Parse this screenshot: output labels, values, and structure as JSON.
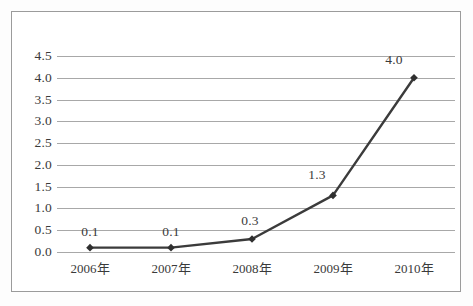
{
  "chart_data": {
    "type": "line",
    "title": "",
    "subtitle": "",
    "xlabel": "",
    "ylabel": "",
    "categories": [
      "2006年",
      "2007年",
      "2008年",
      "2009年",
      "2010年"
    ],
    "series": [
      {
        "name": "",
        "values": [
          0.1,
          0.1,
          0.3,
          1.3,
          4.0
        ],
        "point_labels": [
          "0.1",
          "0.1",
          "0.3",
          "1.3",
          "4.0"
        ],
        "line_color": "#3b3b3b",
        "marker": "diamond",
        "marker_color": "#2f2f2f"
      }
    ],
    "ylim": [
      0.0,
      4.5
    ],
    "ytick_step": 0.5,
    "ytick_labels": [
      "0.0",
      "0.5",
      "1.0",
      "1.5",
      "2.0",
      "2.5",
      "3.0",
      "3.5",
      "4.0",
      "4.5"
    ],
    "ytick_values": [
      0.0,
      0.5,
      1.0,
      1.5,
      2.0,
      2.5,
      3.0,
      3.5,
      4.0,
      4.5
    ],
    "grid": {
      "horizontal": true,
      "vertical": false,
      "color": "#a8a8a8"
    },
    "legend": {
      "visible": false,
      "position": "none",
      "entries": []
    },
    "frame": {
      "border_color": "#9b9b9b",
      "plot_background": "#ffffff"
    }
  }
}
